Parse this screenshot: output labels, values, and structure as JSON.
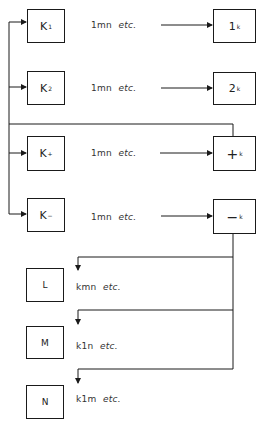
{
  "diagram": {
    "left_nodes": [
      {
        "main": "K",
        "sub": "1",
        "label": "1mn",
        "label_etc": "etc."
      },
      {
        "main": "K",
        "sub": "2",
        "label": "1mn",
        "label_etc": "etc."
      },
      {
        "main": "K",
        "sub": "+",
        "label": "1mn",
        "label_etc": "etc."
      },
      {
        "main": "K",
        "sub": "−",
        "label": "1mn",
        "label_etc": "etc."
      }
    ],
    "right_nodes": [
      {
        "main": "1",
        "sub": "k"
      },
      {
        "main": "2",
        "sub": "k"
      },
      {
        "main": "+",
        "sub": "k"
      },
      {
        "main": "−",
        "sub": "k"
      }
    ],
    "bottom_nodes": [
      {
        "main": "L",
        "label": "kmn",
        "label_etc": "etc."
      },
      {
        "main": "M",
        "label": "k1n",
        "label_etc": "etc."
      },
      {
        "main": "N",
        "label": "k1m",
        "label_etc": "etc."
      }
    ],
    "line_color": "#1a1a1a"
  }
}
